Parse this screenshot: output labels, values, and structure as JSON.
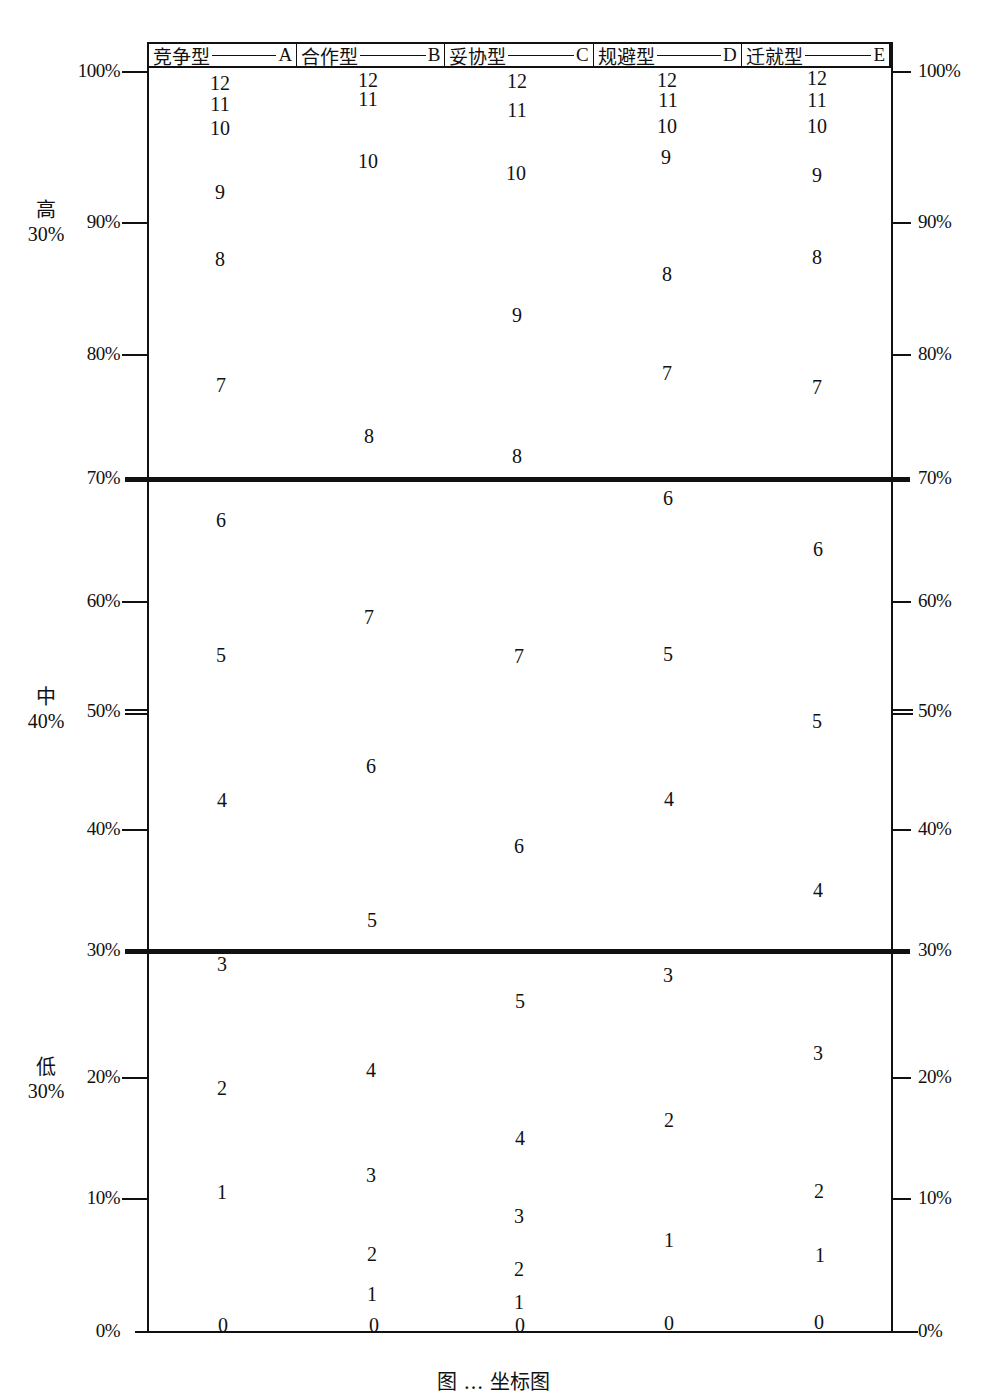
{
  "chart_data": {
    "type": "scatter",
    "title": "",
    "caption_partial": "图 … 坐标图",
    "xlabel": "",
    "ylabel": "Percentile",
    "ylim": [
      0,
      100
    ],
    "grid": false,
    "legend_position": "top header row",
    "categories": [
      "竞争型——A",
      "合作型——B",
      "妥协型——C",
      "规避型——D",
      "迁就型——E"
    ],
    "y_ticks": [
      "0%",
      "10%",
      "20%",
      "30%",
      "40%",
      "50%",
      "60%",
      "70%",
      "80%",
      "90%",
      "100%"
    ],
    "zones": [
      {
        "name": "高",
        "share": "30%",
        "range": [
          70,
          100
        ]
      },
      {
        "name": "中",
        "share": "40%",
        "range": [
          30,
          70
        ]
      },
      {
        "name": "低",
        "share": "30%",
        "range": [
          0,
          30
        ]
      }
    ],
    "series": [
      {
        "name": "竞争型——A",
        "scores": [
          0,
          1,
          2,
          3,
          4,
          5,
          6,
          7,
          8,
          9,
          10,
          11,
          12
        ],
        "percentiles": [
          0,
          11,
          19,
          30,
          43,
          56,
          67,
          78,
          88,
          93,
          97,
          99,
          100
        ]
      },
      {
        "name": "合作型——B",
        "scores": [
          0,
          1,
          2,
          3,
          4,
          5,
          6,
          7,
          8,
          10,
          11,
          12
        ],
        "percentiles": [
          0,
          3,
          6,
          13,
          21,
          33,
          46,
          58,
          74,
          95,
          99,
          100
        ]
      },
      {
        "name": "妥协型——C",
        "scores": [
          0,
          1,
          2,
          3,
          4,
          5,
          6,
          7,
          8,
          9,
          10,
          11,
          12
        ],
        "percentiles": [
          0,
          2,
          5,
          9,
          16,
          27,
          40,
          56,
          72,
          84,
          94,
          98,
          100
        ]
      },
      {
        "name": "规避型——D",
        "scores": [
          0,
          1,
          2,
          3,
          4,
          5,
          6,
          7,
          8,
          9,
          10,
          11,
          12
        ],
        "percentiles": [
          0,
          7,
          17,
          29,
          43,
          56,
          69,
          78,
          87,
          94,
          98,
          99,
          100
        ]
      },
      {
        "name": "迁就型——E",
        "scores": [
          0,
          1,
          2,
          3,
          4,
          5,
          6,
          7,
          8,
          9,
          10,
          11,
          12
        ],
        "percentiles": [
          0,
          6,
          11,
          22,
          35,
          50,
          64,
          77,
          88,
          93,
          98,
          99,
          100
        ]
      }
    ]
  },
  "header": {
    "cells": [
      {
        "name": "竞争型",
        "letter": "A"
      },
      {
        "name": "合作型",
        "letter": "B"
      },
      {
        "name": "妥协型",
        "letter": "C"
      },
      {
        "name": "规避型",
        "letter": "D"
      },
      {
        "name": "迁就型",
        "letter": "E"
      }
    ]
  },
  "axis": {
    "ticks": [
      {
        "label": "100%",
        "y": 72
      },
      {
        "label": "90%",
        "y": 223
      },
      {
        "label": "80%",
        "y": 355
      },
      {
        "label": "70%",
        "y": 479
      },
      {
        "label": "60%",
        "y": 602
      },
      {
        "label": "50%",
        "y": 712
      },
      {
        "label": "40%",
        "y": 830
      },
      {
        "label": "30%",
        "y": 951
      },
      {
        "label": "20%",
        "y": 1078
      },
      {
        "label": "10%",
        "y": 1199
      },
      {
        "label": "0%",
        "y": 1332
      }
    ]
  },
  "zones": {
    "high": {
      "name": "高",
      "share": "30%"
    },
    "mid": {
      "name": "中",
      "share": "40%"
    },
    "low": {
      "name": "低",
      "share": "30%"
    }
  },
  "points": {
    "A": [
      [
        "12",
        220,
        83
      ],
      [
        "11",
        220,
        104
      ],
      [
        "10",
        220,
        128
      ],
      [
        "9",
        220,
        192
      ],
      [
        "8",
        220,
        259
      ],
      [
        "7",
        221,
        385
      ],
      [
        "6",
        221,
        520
      ],
      [
        "5",
        221,
        655
      ],
      [
        "4",
        222,
        800
      ],
      [
        "3",
        222,
        964
      ],
      [
        "2",
        222,
        1088
      ],
      [
        "1",
        222,
        1192
      ],
      [
        "0",
        223,
        1325
      ]
    ],
    "B": [
      [
        "12",
        368,
        80
      ],
      [
        "11",
        368,
        99
      ],
      [
        "10",
        368,
        161
      ],
      [
        "8",
        369,
        436
      ],
      [
        "7",
        369,
        617
      ],
      [
        "6",
        371,
        766
      ],
      [
        "5",
        372,
        920
      ],
      [
        "4",
        371,
        1070
      ],
      [
        "3",
        371,
        1175
      ],
      [
        "2",
        372,
        1254
      ],
      [
        "1",
        372,
        1294
      ],
      [
        "0",
        374,
        1325
      ]
    ],
    "C": [
      [
        "12",
        517,
        81
      ],
      [
        "11",
        517,
        110
      ],
      [
        "10",
        516,
        173
      ],
      [
        "9",
        517,
        315
      ],
      [
        "8",
        517,
        456
      ],
      [
        "7",
        519,
        656
      ],
      [
        "6",
        519,
        846
      ],
      [
        "5",
        520,
        1001
      ],
      [
        "4",
        520,
        1138
      ],
      [
        "3",
        519,
        1216
      ],
      [
        "2",
        519,
        1269
      ],
      [
        "1",
        519,
        1302
      ],
      [
        "0",
        520,
        1325
      ]
    ],
    "D": [
      [
        "12",
        667,
        80
      ],
      [
        "11",
        668,
        100
      ],
      [
        "10",
        667,
        126
      ],
      [
        "9",
        666,
        157
      ],
      [
        "8",
        667,
        274
      ],
      [
        "7",
        667,
        373
      ],
      [
        "6",
        668,
        498
      ],
      [
        "5",
        668,
        654
      ],
      [
        "4",
        669,
        799
      ],
      [
        "3",
        668,
        975
      ],
      [
        "2",
        669,
        1120
      ],
      [
        "1",
        669,
        1240
      ],
      [
        "0",
        669,
        1323
      ]
    ],
    "E": [
      [
        "12",
        817,
        78
      ],
      [
        "11",
        817,
        100
      ],
      [
        "10",
        817,
        126
      ],
      [
        "9",
        817,
        175
      ],
      [
        "8",
        817,
        257
      ],
      [
        "7",
        817,
        387
      ],
      [
        "6",
        818,
        549
      ],
      [
        "5",
        817,
        721
      ],
      [
        "4",
        818,
        890
      ],
      [
        "3",
        818,
        1053
      ],
      [
        "2",
        819,
        1191
      ],
      [
        "1",
        820,
        1255
      ],
      [
        "0",
        819,
        1322
      ]
    ]
  }
}
